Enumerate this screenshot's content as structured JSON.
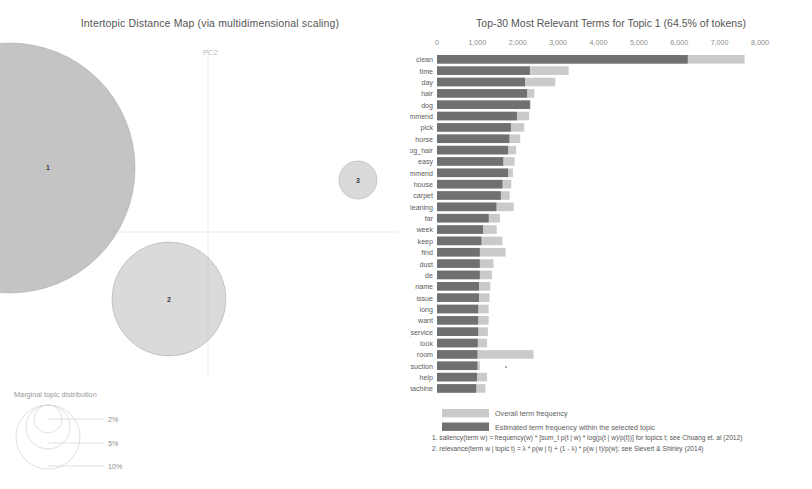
{
  "mds": {
    "title": "Intertopic Distance Map (via multidimensional scaling)",
    "axis_y_label": "PC2",
    "axis_x_label": "PC1",
    "topics": [
      {
        "id": "1",
        "label": "1",
        "x": 10,
        "y": 168,
        "r": 125
      },
      {
        "id": "2",
        "label": "2",
        "x": 169,
        "y": 299,
        "r": 57
      },
      {
        "id": "3",
        "label": "3",
        "x": 358,
        "y": 180,
        "r": 19
      }
    ],
    "legend": {
      "title": "Marginal topic distribution",
      "sizes": [
        {
          "label": "2%",
          "r": 14
        },
        {
          "label": "5%",
          "r": 22
        },
        {
          "label": "10%",
          "r": 32
        }
      ]
    }
  },
  "barchart": {
    "title": "Top-30 Most Relevant Terms for Topic 1 (64.5% of tokens)",
    "legend": [
      {
        "key": "overall",
        "label": "Overall term frequency",
        "color": "#c9cacb"
      },
      {
        "key": "topic",
        "label": "Estimated term frequency within the selected topic",
        "color": "#6f7072"
      }
    ],
    "notes": [
      "1. saliency(term w) = frequency(w) * [sum_t p(t | w) * log(p(t | w)/p(t))] for topics t; see Chuang et. al (2012)",
      "2. relevance(term w | topic t) = λ * p(w | t) + (1 - λ) * p(w | t)/p(w); see Sievert & Shirley (2014)"
    ]
  },
  "chart_data": {
    "type": "bar",
    "title": "Top-30 Most Relevant Terms for Topic 1 (64.5% of tokens)",
    "xlabel": "",
    "ylabel": "",
    "xlim": [
      0,
      8000
    ],
    "xticks": [
      0,
      1000,
      2000,
      3000,
      4000,
      5000,
      6000,
      7000,
      8000
    ],
    "xtick_labels": [
      "0",
      "1,000",
      "2,000",
      "3,000",
      "4,000",
      "5,000",
      "6,000",
      "7,000",
      "8,000"
    ],
    "grid": false,
    "legend_position": "bottom",
    "orientation": "horizontal",
    "categories": [
      "clean",
      "time",
      "day",
      "hair",
      "dog",
      "recommend",
      "pick",
      "horse",
      "dog_hair",
      "easy",
      "highly_recommend",
      "house",
      "carpet",
      "cleaning",
      "far",
      "week",
      "keep",
      "find",
      "dust",
      "de",
      "name",
      "issue",
      "long",
      "want",
      "customer_service",
      "look",
      "room",
      "suction",
      "help",
      "machine"
    ],
    "series": [
      {
        "name": "Overall term frequency",
        "values": [
          7620,
          3260,
          2930,
          2410,
          2320,
          2280,
          2160,
          2060,
          1960,
          1920,
          1880,
          1840,
          1800,
          1900,
          1560,
          1480,
          1620,
          1700,
          1400,
          1360,
          1320,
          1300,
          1280,
          1280,
          1260,
          1240,
          2390,
          1060,
          1240,
          1200
        ]
      },
      {
        "name": "Estimated term frequency within the selected topic",
        "values": [
          6210,
          2300,
          2180,
          2230,
          2300,
          1980,
          1830,
          1790,
          1760,
          1640,
          1760,
          1620,
          1580,
          1470,
          1280,
          1140,
          1100,
          1060,
          1060,
          1060,
          1040,
          1040,
          1020,
          1020,
          1020,
          1010,
          1000,
          1000,
          990,
          970
        ]
      }
    ]
  }
}
